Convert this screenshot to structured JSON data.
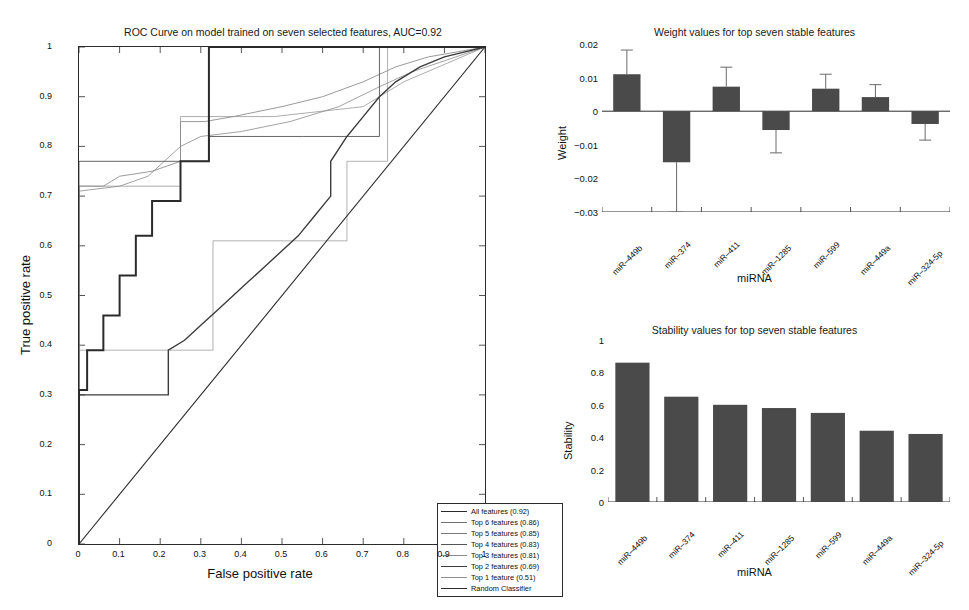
{
  "chart_data": [
    {
      "id": "roc",
      "type": "line",
      "title": "ROC Curve on model trained on seven selected features, AUC=0.92",
      "xlabel": "False positive rate",
      "ylabel": "True positive rate",
      "xlim": [
        0,
        1
      ],
      "ylim": [
        0,
        1
      ],
      "xticks": [
        "0",
        "0.1",
        "0.2",
        "0.3",
        "0.4",
        "0.5",
        "0.6",
        "0.7",
        "0.8",
        "0.9",
        "1"
      ],
      "yticks": [
        "0",
        "0.1",
        "0.2",
        "0.3",
        "0.4",
        "0.5",
        "0.6",
        "0.7",
        "0.8",
        "0.9",
        "1"
      ],
      "grid": false,
      "legend_position": "lower-right",
      "series": [
        {
          "name": "All features (0.92)",
          "auc": 0.92,
          "width": 2.0,
          "color": "#2b2b2b",
          "points": [
            [
              0,
              0
            ],
            [
              0,
              0.31
            ],
            [
              0.02,
              0.31
            ],
            [
              0.02,
              0.39
            ],
            [
              0.06,
              0.39
            ],
            [
              0.06,
              0.46
            ],
            [
              0.1,
              0.46
            ],
            [
              0.1,
              0.54
            ],
            [
              0.14,
              0.54
            ],
            [
              0.14,
              0.62
            ],
            [
              0.18,
              0.62
            ],
            [
              0.18,
              0.69
            ],
            [
              0.25,
              0.69
            ],
            [
              0.25,
              0.77
            ],
            [
              0.32,
              0.77
            ],
            [
              0.32,
              1.0
            ],
            [
              1,
              1
            ]
          ]
        },
        {
          "name": "Top 6 features (0.86)",
          "auc": 0.86,
          "width": 0.7,
          "color": "#6f6f6f",
          "points": [
            [
              0,
              0
            ],
            [
              0,
              0.72
            ],
            [
              0.06,
              0.72
            ],
            [
              0.1,
              0.74
            ],
            [
              0.18,
              0.75
            ],
            [
              0.25,
              0.77
            ],
            [
              0.25,
              0.85
            ],
            [
              0.31,
              0.85
            ],
            [
              0.38,
              0.86
            ],
            [
              0.5,
              0.88
            ],
            [
              0.6,
              0.9
            ],
            [
              0.7,
              0.93
            ],
            [
              0.78,
              0.96
            ],
            [
              0.86,
              0.98
            ],
            [
              1,
              1
            ]
          ]
        },
        {
          "name": "Top 5 features (0.85)",
          "auc": 0.85,
          "width": 0.7,
          "color": "#7a7a7a",
          "points": [
            [
              0,
              0
            ],
            [
              0,
              0.71
            ],
            [
              0.1,
              0.72
            ],
            [
              0.17,
              0.74
            ],
            [
              0.25,
              0.8
            ],
            [
              0.3,
              0.82
            ],
            [
              0.4,
              0.83
            ],
            [
              0.52,
              0.85
            ],
            [
              0.64,
              0.88
            ],
            [
              0.74,
              0.92
            ],
            [
              0.82,
              0.95
            ],
            [
              1,
              1
            ]
          ]
        },
        {
          "name": "Top 4 features (0.83)",
          "auc": 0.83,
          "width": 0.9,
          "color": "#555555",
          "points": [
            [
              0,
              0
            ],
            [
              0,
              0.77
            ],
            [
              0.32,
              0.77
            ],
            [
              0.32,
              0.82
            ],
            [
              0.55,
              0.82
            ],
            [
              0.74,
              0.82
            ],
            [
              0.74,
              1.0
            ],
            [
              1,
              1
            ]
          ]
        },
        {
          "name": "Top 3 features (0.81)",
          "auc": 0.81,
          "width": 0.7,
          "color": "#8a8a8a",
          "points": [
            [
              0,
              0
            ],
            [
              0,
              0.72
            ],
            [
              0.25,
              0.72
            ],
            [
              0.25,
              0.86
            ],
            [
              0.48,
              0.86
            ],
            [
              0.7,
              0.88
            ],
            [
              0.8,
              0.93
            ],
            [
              1,
              1
            ]
          ]
        },
        {
          "name": "Top 2 features (0.69)",
          "auc": 0.69,
          "width": 1.4,
          "color": "#3c3c3c",
          "points": [
            [
              0,
              0
            ],
            [
              0,
              0.3
            ],
            [
              0.22,
              0.3
            ],
            [
              0.22,
              0.39
            ],
            [
              0.26,
              0.41
            ],
            [
              0.3,
              0.44
            ],
            [
              0.34,
              0.47
            ],
            [
              0.38,
              0.5
            ],
            [
              0.42,
              0.53
            ],
            [
              0.46,
              0.56
            ],
            [
              0.5,
              0.59
            ],
            [
              0.54,
              0.62
            ],
            [
              0.58,
              0.66
            ],
            [
              0.62,
              0.7
            ],
            [
              0.62,
              0.77
            ],
            [
              0.66,
              0.82
            ],
            [
              0.7,
              0.86
            ],
            [
              0.74,
              0.9
            ],
            [
              0.78,
              0.93
            ],
            [
              0.84,
              0.96
            ],
            [
              0.9,
              0.98
            ],
            [
              1,
              1
            ]
          ]
        },
        {
          "name": "Top 1 feature (0.51)",
          "auc": 0.51,
          "width": 0.7,
          "color": "#909090",
          "points": [
            [
              0,
              0
            ],
            [
              0,
              0.39
            ],
            [
              0.33,
              0.39
            ],
            [
              0.33,
              0.61
            ],
            [
              0.66,
              0.61
            ],
            [
              0.66,
              0.77
            ],
            [
              0.76,
              0.77
            ],
            [
              0.76,
              1.0
            ],
            [
              1,
              1
            ]
          ]
        },
        {
          "name": "Random Classifier",
          "width": 1.1,
          "color": "#2b2b2b",
          "points": [
            [
              0,
              0
            ],
            [
              1,
              1
            ]
          ]
        }
      ]
    },
    {
      "id": "weights",
      "type": "bar",
      "title": "Weight values for top seven stable features",
      "xlabel": "miRNA",
      "ylabel": "Weight",
      "ylim": [
        -0.03,
        0.02
      ],
      "yticks": [
        "0.02",
        "0.01",
        "0",
        "-0.01",
        "-0.02",
        "-0.03"
      ],
      "grid": false,
      "bar_color": "#4a4a4a",
      "categories": [
        "miR-449b",
        "miR-374",
        "miR-411",
        "miR-1285",
        "miR-599",
        "miR-449a",
        "miR-324-5p"
      ],
      "values": [
        0.011,
        -0.0152,
        0.0073,
        -0.0056,
        0.0067,
        0.0042,
        -0.0038
      ],
      "errors": [
        0.0072,
        0.0148,
        0.0058,
        0.0068,
        0.0043,
        0.0037,
        0.0048
      ]
    },
    {
      "id": "stability",
      "type": "bar",
      "title": "Stability values for top seven stable features",
      "xlabel": "miRNA",
      "ylabel": "Stability",
      "ylim": [
        0,
        1
      ],
      "yticks": [
        "1",
        "0.8",
        "0.6",
        "0.4",
        "0.2",
        "0"
      ],
      "grid": false,
      "bar_color": "#4a4a4a",
      "categories": [
        "miR-449b",
        "miR-374",
        "miR-411",
        "miR-1285",
        "miR-599",
        "miR-449a",
        "miR-324-5p"
      ],
      "values": [
        0.86,
        0.65,
        0.6,
        0.58,
        0.55,
        0.44,
        0.42
      ]
    }
  ]
}
